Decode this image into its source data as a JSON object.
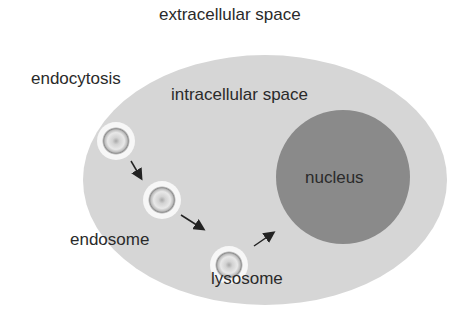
{
  "labels": {
    "extracellular": "extracellular space",
    "endocytosis": "endocytosis",
    "intracellular": "intracellular space",
    "nucleus": "nucleus",
    "endosome": "endosome",
    "lysosome": "lysosome"
  },
  "colors": {
    "cytoplasm": "#d6d6d6",
    "nucleus": "#8a8a8a",
    "vesicle_rim": "#f4f4f4",
    "arrow": "#222222",
    "text": "#2a2a2a"
  }
}
